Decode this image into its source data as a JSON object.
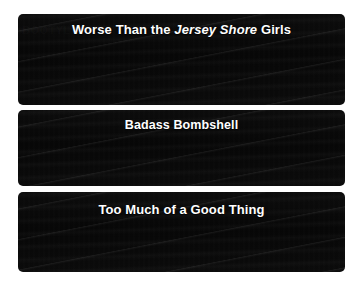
{
  "page": {
    "background_color": "#ffffff",
    "width": 361,
    "height": 288
  },
  "panels": [
    {
      "id": "panel-worse-than-jersey-shore-girls",
      "headline_prefix": "Worse Than the ",
      "headline_italic": "Jersey Shore",
      "headline_suffix": " Girls",
      "headline_full": "Worse Than the Jersey Shore Girls",
      "background_color": "#0a0a0a",
      "text_color": "#ffffff",
      "ghost_text": [
        "BOOTYLA"
      ]
    },
    {
      "id": "panel-badass-bombshell",
      "headline_prefix": "Badass Bombshell",
      "headline_italic": "",
      "headline_suffix": "",
      "headline_full": "Badass Bombshell",
      "background_color": "#0a0a0a",
      "text_color": "#ffffff",
      "ghost_text": []
    },
    {
      "id": "panel-too-much-of-a-good-thing",
      "headline_prefix": "Too Much of a Good Thing",
      "headline_italic": "",
      "headline_suffix": "",
      "headline_full": "Too Much of a Good Thing",
      "background_color": "#0a0a0a",
      "text_color": "#ffffff",
      "ghost_text": []
    }
  ]
}
